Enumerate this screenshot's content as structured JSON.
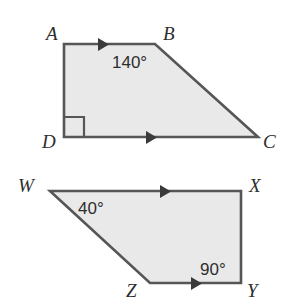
{
  "figure": {
    "background_color": "#ffffff",
    "fill_color": "#e9e9e9",
    "stroke_color": "#565656",
    "text_color": "#2e2e2e"
  },
  "shapes": [
    {
      "id": "trapezoid-abcd",
      "name": "Trapezoid ABCD",
      "vertices": [
        {
          "key": "A",
          "label": "A",
          "x": 64,
          "y": 44,
          "label_x": 46,
          "label_y": 40
        },
        {
          "key": "B",
          "label": "B",
          "x": 155,
          "y": 44,
          "label_x": 163,
          "label_y": 40
        },
        {
          "key": "C",
          "label": "C",
          "x": 258,
          "y": 137,
          "label_x": 263,
          "label_y": 148
        },
        {
          "key": "D",
          "label": "D",
          "x": 64,
          "y": 137,
          "label_x": 42,
          "label_y": 148
        }
      ],
      "angle_labels": [
        {
          "key": "angle-b",
          "text": "140°",
          "value": 140,
          "at_vertex": "B",
          "x": 112,
          "y": 68
        }
      ],
      "right_angle_marks": [
        {
          "key": "right-angle-d",
          "at_vertex": "D",
          "x": 64,
          "y": 137,
          "size": 20
        }
      ],
      "parallel_marks": [
        {
          "key": "arrow-ab",
          "on_side": "AB",
          "x": 98,
          "y": 44,
          "direction": "right",
          "ticks": 1
        },
        {
          "key": "arrow-dc",
          "on_side": "DC",
          "x": 146,
          "y": 137,
          "direction": "right",
          "ticks": 1
        }
      ]
    },
    {
      "id": "trapezoid-wxyz",
      "name": "Trapezoid WXYZ",
      "vertices": [
        {
          "key": "W",
          "label": "W",
          "x": 50,
          "y": 191,
          "label_x": 18,
          "label_y": 192
        },
        {
          "key": "X",
          "label": "X",
          "x": 241,
          "y": 191,
          "label_x": 249,
          "label_y": 192
        },
        {
          "key": "Y",
          "label": "Y",
          "x": 241,
          "y": 283,
          "label_x": 247,
          "label_y": 297
        },
        {
          "key": "Z",
          "label": "Z",
          "x": 150,
          "y": 283,
          "label_x": 126,
          "label_y": 297
        }
      ],
      "angle_labels": [
        {
          "key": "angle-w",
          "text": "40°",
          "value": 40,
          "at_vertex": "W",
          "x": 78,
          "y": 214
        },
        {
          "key": "angle-y",
          "text": "90°",
          "value": 90,
          "at_vertex": "Y",
          "x": 200,
          "y": 275
        }
      ],
      "right_angle_marks": [],
      "parallel_marks": [
        {
          "key": "arrow-wx",
          "on_side": "WX",
          "x": 160,
          "y": 191,
          "direction": "right",
          "ticks": 1
        },
        {
          "key": "arrow-zy",
          "on_side": "ZY",
          "x": 191,
          "y": 283,
          "direction": "right",
          "ticks": 1
        }
      ]
    }
  ]
}
